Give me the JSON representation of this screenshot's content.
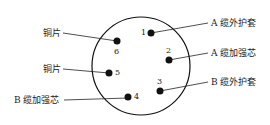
{
  "diagram": {
    "type": "connector-pinout",
    "pins": [
      {
        "id": "1",
        "label": "A 缆外护套"
      },
      {
        "id": "2",
        "label": "A 缆加强芯"
      },
      {
        "id": "3",
        "label": "B 缆外护套"
      },
      {
        "id": "4",
        "label": "B 缆加强芯"
      },
      {
        "id": "5",
        "label": "铜片"
      },
      {
        "id": "6",
        "label": "铜片"
      }
    ]
  }
}
